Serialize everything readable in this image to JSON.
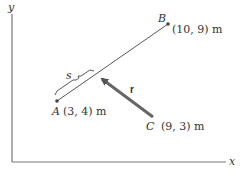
{
  "axes": {
    "x_label": "x",
    "y_label": "y"
  },
  "points": {
    "A": {
      "name": "A",
      "coords": "(3, 4) m"
    },
    "B": {
      "name": "B",
      "coords": "(10, 9) m"
    },
    "C": {
      "name": "C",
      "coords": "(9, 3) m"
    }
  },
  "segment_label": "s",
  "vector_label": "r",
  "colors": {
    "line": "#444444",
    "vector": "#666666",
    "axis": "#777777"
  }
}
